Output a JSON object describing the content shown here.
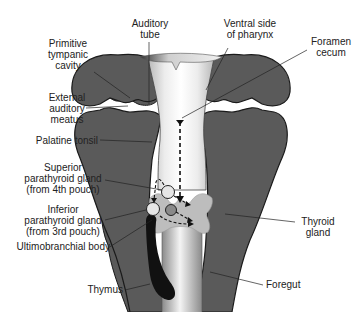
{
  "colors": {
    "arch_fill": "#5a5a5a",
    "arch_stroke": "#1a1a1a",
    "pharynx_light": "#f2f2f2",
    "pharynx_mid": "#cfcfcf",
    "thyroid": "#bdbdbd",
    "thymus": "#111111",
    "gland_fill": "#e6e6e6",
    "label_text": "#222222",
    "background": "#ffffff"
  },
  "labels": {
    "auditory_tube": "Auditory\ntube",
    "ventral_side": "Ventral side\nof pharynx",
    "primitive_tympanic": "Primitive\ntympanic\ncavity",
    "foramen_cecum": "Foramen\ncecum",
    "external_auditory": "External\nauditory\nmeatus",
    "palatine_tonsil": "Palatine tonsil",
    "superior_parathyroid": "Superior\nparathyroid gland\n(from 4th pouch)",
    "inferior_parathyroid": "Inferior\nparathyroid gland\n(from 3rd pouch)",
    "ultimobranchial": "Ultimobranchial body",
    "thyroid_gland": "Thyroid\ngland",
    "thymus": "Thymus",
    "foregut": "Foregut"
  },
  "structures": [
    "pharyngeal-arch-left",
    "pharyngeal-arch-right",
    "pharynx-lumen",
    "thyroid-gland",
    "superior-parathyroid-gland",
    "inferior-parathyroid-gland",
    "ultimobranchial-body",
    "thymus",
    "foregut",
    "thyroid-descent-path",
    "gland-migration-arrows"
  ]
}
